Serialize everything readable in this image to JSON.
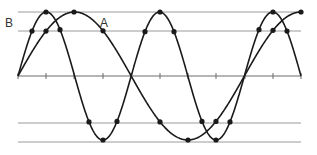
{
  "diagram": {
    "title": "",
    "labels": {
      "wave_a": "A",
      "wave_b": "B"
    },
    "colors": {
      "curve": "#1a1a1a",
      "reference_line": "#9a9a9a",
      "axis": "#6a6a6a",
      "dot": "#1a1a1a",
      "text": "#333333"
    },
    "axis": {
      "y": 76,
      "x_start": 18,
      "x_end": 301,
      "ticks_x": [
        18,
        46,
        74,
        103,
        131,
        160,
        188,
        216,
        245,
        273,
        301
      ]
    },
    "reference_lines_y": [
      12,
      31,
      123,
      142
    ],
    "reference_lines_x": [
      18,
      301
    ],
    "amplitude_px": 64,
    "waves": [
      {
        "name": "A",
        "period_px": 226.4,
        "phase_start_x": 18,
        "dots_x": [
          46,
          74,
          103,
          160,
          188,
          216,
          273,
          301
        ]
      },
      {
        "name": "B",
        "period_px": 113.2,
        "phase_start_x": 18,
        "dots_x": [
          32,
          46,
          60,
          89,
          103,
          117,
          145,
          160,
          174,
          202,
          216,
          230,
          259,
          273,
          287
        ]
      }
    ]
  }
}
